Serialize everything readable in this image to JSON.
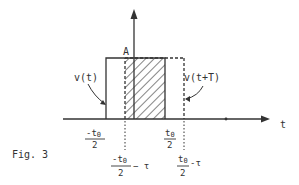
{
  "figure": {
    "caption": "Fig. 3",
    "axis_label_t": "t",
    "amplitude_label": "A",
    "signal_labels": {
      "v_t": "v(t)",
      "v_t_plus_T": "v(t+T)"
    },
    "tick_labels": {
      "neg_half_t0": {
        "num": "-t",
        "sub": "0",
        "den": "2"
      },
      "half_t0": {
        "num": "t",
        "sub": "0",
        "den": "2"
      },
      "neg_half_t0_minus_tau": {
        "num": "-t",
        "sub": "0",
        "den": "2",
        "suffix": "− τ"
      },
      "half_t0_minus_tau": {
        "num": "t",
        "sub": "0",
        "den": "2",
        "suffix": "-τ"
      }
    },
    "colors": {
      "line": "#333333",
      "background": "#ffffff"
    }
  }
}
